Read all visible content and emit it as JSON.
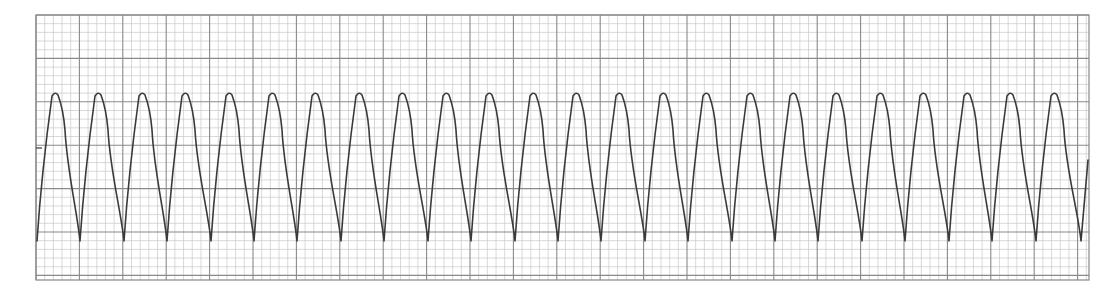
{
  "chart_data": {
    "type": "line",
    "title": "",
    "xlabel": "",
    "ylabel": "",
    "grid": {
      "on": true,
      "small_box_px": 8.68,
      "large_box_px": 43.4,
      "x_range_px": [
        36,
        1089
      ],
      "y_range_px": [
        15,
        280
      ],
      "minor_color": "#c9c9c9",
      "major_color": "#8a8a8a",
      "border_color": "#888888"
    },
    "trace": {
      "color": "#3a3a3a",
      "stroke_width": 1.6,
      "baseline_y_px": 148,
      "peak_y_px": 93,
      "shoulder_y_px": 130,
      "trough_y_px": 241,
      "period_px": 43.4,
      "first_trough_x_px": 37,
      "first_peak_x_px": 55,
      "end_x_px": 1088,
      "end_y_px": 160,
      "beat_count": 24
    },
    "series": [
      {
        "name": "ECG lead",
        "peak_x": [
          55,
          98,
          142,
          185,
          229,
          272,
          315,
          359,
          402,
          446,
          489,
          533,
          576,
          619,
          663,
          706,
          750,
          793,
          836,
          880,
          923,
          967,
          1010,
          1054
        ],
        "trough_x": [
          37,
          80,
          124,
          167,
          211,
          254,
          297,
          341,
          384,
          428,
          471,
          515,
          558,
          601,
          645,
          688,
          732,
          775,
          818,
          862,
          905,
          949,
          992,
          1036,
          1081
        ]
      }
    ],
    "legend": null
  }
}
